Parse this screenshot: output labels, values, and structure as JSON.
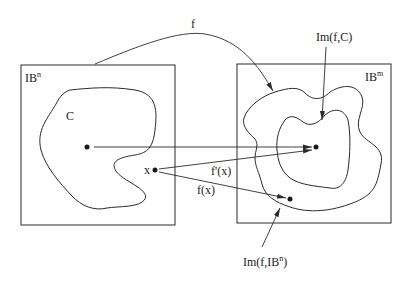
{
  "diagram": {
    "type": "mapping-diagram",
    "labels": {
      "map": "f",
      "domain_space": "IB",
      "domain_space_sup": "n",
      "codomain_space": "IB",
      "codomain_space_sup": "m",
      "set_c": "C",
      "point_x": "x",
      "image_c": "Im(f,C)",
      "derivative": "f'(x)",
      "value": "f(x)",
      "image_domain_prefix": "Im(f,IB",
      "image_domain_sup": "n",
      "image_domain_suffix": ")"
    },
    "colors": {
      "background": "#ffffff",
      "stroke": "#2a2a2a",
      "text": "#1a1a1a"
    }
  }
}
